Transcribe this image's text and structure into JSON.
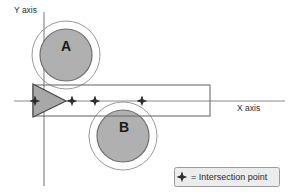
{
  "figure": {
    "background_color": "#ffffff",
    "axes": {
      "x_label": "X axis",
      "y_label": "Y axis",
      "axis_color": "#8c8c8c",
      "x_line": {
        "x1": 14,
        "y1": 101,
        "x2": 285,
        "y2": 101
      },
      "y_line": {
        "x1": 44,
        "y1": 12,
        "x2": 44,
        "y2": 186
      },
      "x_label_pos": {
        "x": 237,
        "y": 111
      },
      "y_label_pos": {
        "x": 14,
        "y": 13
      }
    },
    "circles": [
      {
        "name": "A",
        "label": "A",
        "label_pos": {
          "x": 61,
          "y": 51
        },
        "cx": 66,
        "cy": 55,
        "inner_r": 26,
        "outer_r": 34,
        "fill": "#b0b0b0",
        "stroke": "#6e6e6e",
        "outer_stroke": "#9a9a9a"
      },
      {
        "name": "B",
        "label": "B",
        "label_pos": {
          "x": 119,
          "y": 132
        },
        "cx": 123,
        "cy": 136,
        "inner_r": 26,
        "outer_r": 34,
        "fill": "#b0b0b0",
        "stroke": "#6e6e6e",
        "outer_stroke": "#9a9a9a"
      }
    ],
    "rectangle": {
      "x": 33,
      "y": 85,
      "width": 177,
      "height": 31,
      "fill": "none",
      "stroke": "#6e6e6e"
    },
    "triangle": {
      "points": "33,84 33,117 66,101",
      "fill": "#a8a8a8",
      "stroke": "#4a4a4a"
    },
    "intersection_points": [
      {
        "x": 35,
        "y": 101
      },
      {
        "x": 72,
        "y": 101
      },
      {
        "x": 95,
        "y": 101
      },
      {
        "x": 142,
        "y": 101
      }
    ],
    "legend": {
      "icon_name": "star-icon",
      "text": "= Intersection point",
      "box": {
        "x": 174,
        "y": 167,
        "width": 106,
        "height": 20
      },
      "box_fill": "#ececec",
      "box_stroke": "#9a9a9a",
      "icon_pos": {
        "x": 182,
        "y": 177
      },
      "text_pos": {
        "x": 194,
        "y": 180
      }
    },
    "colors": {
      "circle_fill": "#b0b0b0",
      "circle_stroke": "#6e6e6e",
      "axis": "#8c8c8c",
      "star": "#2e2e2e",
      "legend_bg": "#ececec"
    }
  }
}
